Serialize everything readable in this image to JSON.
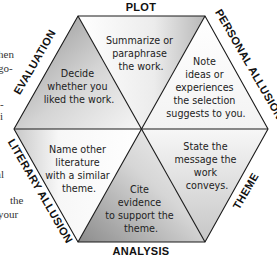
{
  "diagram": {
    "type": "hexagon",
    "side_labels": {
      "top": "PLOT",
      "top_right": "PERSONAL ALLUSION",
      "bottom_right": "THEME",
      "bottom": "ANALYSIS",
      "bottom_left": "LITERARY ALLUSION",
      "top_left": "EVALUATION"
    },
    "sections": [
      {
        "id": "plot",
        "lines": [
          "Summarize or",
          "paraphrase",
          "the work."
        ]
      },
      {
        "id": "personal-allusion",
        "lines": [
          "Note",
          "ideas or",
          "experiences",
          "the selection",
          "suggests to you."
        ]
      },
      {
        "id": "theme",
        "lines": [
          "State the",
          "message the",
          "work",
          "conveys."
        ]
      },
      {
        "id": "analysis",
        "lines": [
          "Cite",
          "evidence",
          "to support the",
          "theme."
        ]
      },
      {
        "id": "literary-allusion",
        "lines": [
          "Name other",
          "literature",
          "with a similar",
          "theme."
        ]
      },
      {
        "id": "evaluation",
        "lines": [
          "Decide",
          "whether you",
          "liked the work."
        ]
      }
    ],
    "colors": {
      "shaded_dark": "#9a9a9a",
      "shaded_light": "#f2f2f2",
      "edge": "#1a1a1a"
    }
  },
  "margin_fragments": [
    "hen",
    "go-",
    "-",
    "i",
    "al",
    "the",
    "your"
  ]
}
